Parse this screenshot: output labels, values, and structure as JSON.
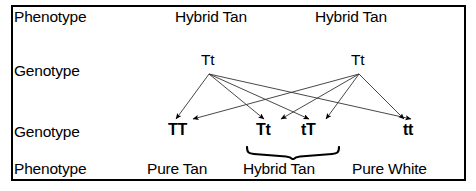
{
  "diagram": {
    "border_color": "#000000",
    "background_color": "#ffffff",
    "text_color": "#000000",
    "rows": [
      {
        "id": "row-phenotype-parents",
        "label": "Phenotype"
      },
      {
        "id": "row-genotype-parents",
        "label": "Genotype"
      },
      {
        "id": "row-genotype-offspring",
        "label": "Genotype"
      },
      {
        "id": "row-phenotype-offspring",
        "label": "Phenotype"
      }
    ],
    "parents": {
      "phenotypes": [
        {
          "id": "parent-phenotype-left",
          "text": "Hybrid Tan",
          "x": 175,
          "y": 9
        },
        {
          "id": "parent-phenotype-right",
          "text": "Hybrid Tan",
          "x": 315,
          "y": 9
        }
      ],
      "genotypes": [
        {
          "id": "parent-genotype-left",
          "text": "Tt",
          "x": 201,
          "y": 52
        },
        {
          "id": "parent-genotype-right",
          "text": "Tt",
          "x": 351,
          "y": 52
        }
      ]
    },
    "offspring": {
      "genotypes": [
        {
          "id": "offspring-genotype-1",
          "text": "TT",
          "x": 168,
          "y": 122
        },
        {
          "id": "offspring-genotype-2",
          "text": "Tt",
          "x": 256,
          "y": 122
        },
        {
          "id": "offspring-genotype-3",
          "text": "tT",
          "x": 301,
          "y": 122
        },
        {
          "id": "offspring-genotype-4",
          "text": "tt",
          "x": 403,
          "y": 122
        }
      ],
      "phenotypes": [
        {
          "id": "offspring-phenotype-pure-tan",
          "text": "Pure Tan",
          "x": 147,
          "y": 161
        },
        {
          "id": "offspring-phenotype-hybrid-tan",
          "text": "Hybrid Tan",
          "x": 243,
          "y": 161
        },
        {
          "id": "offspring-phenotype-pure-white",
          "text": "Pure White",
          "x": 352,
          "y": 161
        }
      ],
      "brace": {
        "id": "hybrid-tan-brace",
        "label_for": "Hybrid Tan",
        "left_x": 247,
        "right_x": 337,
        "y": 150
      }
    },
    "arrows": {
      "stroke": "#333333",
      "stroke_width": 0.9,
      "head_color": "#000000",
      "from_left_parent": {
        "origin_x": 209,
        "origin_y": 74,
        "targets": [
          {
            "to": "TT",
            "x": 176,
            "y": 119
          },
          {
            "to": "Tt",
            "x": 264,
            "y": 119
          },
          {
            "to": "tT",
            "x": 309,
            "y": 119
          },
          {
            "to": "tt",
            "x": 411,
            "y": 119
          }
        ]
      },
      "from_right_parent": {
        "origin_x": 359,
        "origin_y": 74,
        "targets": [
          {
            "to": "TT",
            "x": 193,
            "y": 119
          },
          {
            "to": "Tt",
            "x": 281,
            "y": 119
          },
          {
            "to": "tT",
            "x": 326,
            "y": 119
          },
          {
            "to": "tt",
            "x": 404,
            "y": 119
          }
        ]
      }
    }
  }
}
